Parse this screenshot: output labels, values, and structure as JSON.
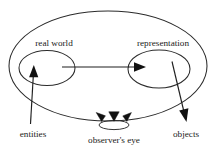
{
  "diagram": {
    "type": "conceptual-ellipse-diagram",
    "background_color": "#ffffff",
    "stroke_color": "#2b2b2b",
    "text_color": "#1a1a1a",
    "outer_region": {
      "name": "outer-boundary",
      "label": ""
    },
    "nodes": [
      {
        "id": "real-world",
        "label": "real world",
        "shape": "ellipse",
        "cx": 47,
        "cy": 68,
        "rx": 28,
        "ry": 17.5,
        "label_x": 54,
        "label_y": 46
      },
      {
        "id": "representation",
        "label": "representation",
        "shape": "ellipse",
        "cx": 159,
        "cy": 69,
        "rx": 31,
        "ry": 19,
        "label_x": 163,
        "label_y": 46
      }
    ],
    "annotations": [
      {
        "id": "entities",
        "label": "entities",
        "label_x": 33,
        "label_y": 137,
        "arrow": "points up into real world ellipse"
      },
      {
        "id": "objects",
        "label": "objects",
        "label_x": 186,
        "label_y": 137,
        "arrow": "points down out of representation ellipse"
      },
      {
        "id": "observers-eye",
        "label": "observer's eye",
        "label_x": 114,
        "label_y": 143,
        "shape": "small ellipse with three sight wedges"
      }
    ],
    "connector": {
      "id": "mapping-arrow",
      "from": "real-world",
      "to": "representation",
      "direction": "left-to-right",
      "label": ""
    }
  }
}
